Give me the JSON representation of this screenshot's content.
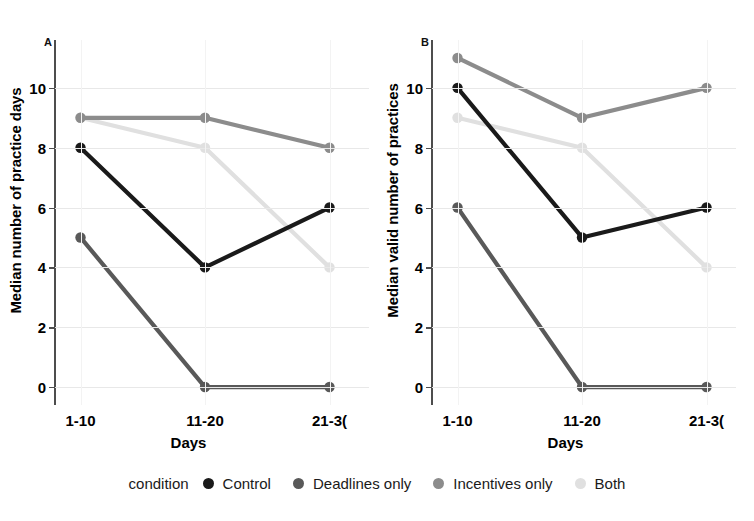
{
  "chart_data": [
    {
      "type": "line",
      "panel": "A",
      "title": "",
      "xlabel": "Days",
      "ylabel": "Median number of practice days",
      "categories": [
        "1-10",
        "11-20",
        "21-30"
      ],
      "xtick_labels": [
        "1-10",
        "11-20",
        "21-3("
      ],
      "ytick_labels": [
        "0",
        "2",
        "4",
        "6",
        "8",
        "10"
      ],
      "yticks": [
        0,
        2,
        4,
        6,
        8,
        10
      ],
      "ylim": [
        -0.6,
        11.6
      ],
      "grid": true,
      "legend_position": "bottom",
      "series": [
        {
          "name": "Control",
          "values": [
            8,
            4,
            6
          ],
          "color": "#1a1a1a"
        },
        {
          "name": "Deadlines only",
          "values": [
            5,
            0,
            0
          ],
          "color": "#595959"
        },
        {
          "name": "Incentives only",
          "values": [
            9,
            9,
            8
          ],
          "color": "#8c8c8c"
        },
        {
          "name": "Both",
          "values": [
            9,
            8,
            4
          ],
          "color": "#e0e0e0"
        }
      ]
    },
    {
      "type": "line",
      "panel": "B",
      "title": "",
      "xlabel": "Days",
      "ylabel": "Median valid number of practices",
      "categories": [
        "1-10",
        "11-20",
        "21-30"
      ],
      "xtick_labels": [
        "1-10",
        "11-20",
        "21-3("
      ],
      "ytick_labels": [
        "0",
        "2",
        "4",
        "6",
        "8",
        "10"
      ],
      "yticks": [
        0,
        2,
        4,
        6,
        8,
        10
      ],
      "ylim": [
        -0.6,
        11.6
      ],
      "grid": true,
      "legend_position": "bottom",
      "series": [
        {
          "name": "Control",
          "values": [
            10,
            5,
            6
          ],
          "color": "#1a1a1a"
        },
        {
          "name": "Deadlines only",
          "values": [
            6,
            0,
            0
          ],
          "color": "#595959"
        },
        {
          "name": "Incentives only",
          "values": [
            11,
            9,
            10
          ],
          "color": "#8c8c8c"
        },
        {
          "name": "Both",
          "values": [
            9,
            8,
            4
          ],
          "color": "#e0e0e0"
        }
      ]
    }
  ],
  "panelA": {
    "letter": "A",
    "ylabel": "Median number of practice days",
    "xlabel": "Days",
    "ytick_0": "0",
    "ytick_1": "2",
    "ytick_2": "4",
    "ytick_3": "6",
    "ytick_4": "8",
    "ytick_5": "10",
    "xtick_0": "1-10",
    "xtick_1": "11-20",
    "xtick_2": "21-3("
  },
  "panelB": {
    "letter": "B",
    "ylabel": "Median valid number of practices",
    "xlabel": "Days",
    "ytick_0": "0",
    "ytick_1": "2",
    "ytick_2": "4",
    "ytick_3": "6",
    "ytick_4": "8",
    "ytick_5": "10",
    "xtick_0": "1-10",
    "xtick_1": "11-20",
    "xtick_2": "21-3("
  },
  "legend": {
    "title": "condition",
    "items": [
      {
        "label": "Control",
        "color": "#1a1a1a"
      },
      {
        "label": "Deadlines only",
        "color": "#595959"
      },
      {
        "label": "Incentives only",
        "color": "#8c8c8c"
      },
      {
        "label": "Both",
        "color": "#e0e0e0"
      }
    ]
  }
}
